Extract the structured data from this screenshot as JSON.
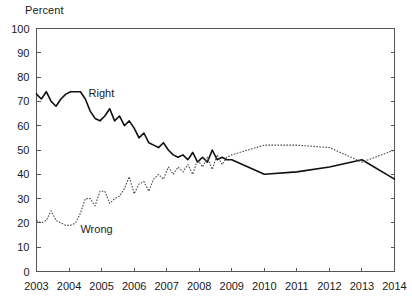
{
  "chart_data": {
    "type": "line",
    "title": "",
    "subtitle": "",
    "xlabel": "",
    "ylabel": "Percent",
    "ylim": [
      0,
      100
    ],
    "xlim": [
      2003,
      2014
    ],
    "grid": false,
    "legend_position": "inline-annotation",
    "yticks": [
      0,
      10,
      20,
      30,
      40,
      50,
      60,
      70,
      80,
      90,
      100
    ],
    "xticks": [
      2003,
      2004,
      2005,
      2006,
      2007,
      2008,
      2009,
      2010,
      2011,
      2012,
      2013,
      2014
    ],
    "xtick_labels": [
      "2003",
      "2004",
      "2005",
      "2006",
      "2007",
      "2008",
      "2009",
      "2010",
      "2011",
      "2012",
      "2013",
      "2014"
    ],
    "ytick_labels": [
      "0",
      "10",
      "20",
      "30",
      "40",
      "50",
      "60",
      "70",
      "80",
      "90",
      "100"
    ],
    "annotations": [
      {
        "text": "Right",
        "x": 2004.6,
        "y": 72
      },
      {
        "text": "Wrong",
        "x": 2004.35,
        "y": 16
      }
    ],
    "series": [
      {
        "name": "Right",
        "style": "solid",
        "color": "#111111",
        "label_text": "Right",
        "x": [
          2003.0,
          2003.15,
          2003.3,
          2003.45,
          2003.6,
          2003.75,
          2003.9,
          2004.05,
          2004.2,
          2004.35,
          2004.5,
          2004.65,
          2004.8,
          2004.95,
          2005.1,
          2005.25,
          2005.4,
          2005.55,
          2005.7,
          2005.85,
          2006.0,
          2006.15,
          2006.3,
          2006.45,
          2006.6,
          2006.75,
          2006.9,
          2007.05,
          2007.2,
          2007.35,
          2007.5,
          2007.65,
          2007.8,
          2007.95,
          2008.1,
          2008.25,
          2008.4,
          2008.55,
          2008.7,
          2008.85,
          2009.0,
          2010.0,
          2011.0,
          2012.0,
          2013.0,
          2014.0
        ],
        "y": [
          73,
          71,
          74,
          70,
          68,
          71,
          73,
          74,
          74,
          74,
          71,
          66,
          63,
          62,
          64,
          67,
          62,
          64,
          60,
          62,
          59,
          55,
          57,
          53,
          52,
          51,
          53,
          50,
          48,
          47,
          48,
          46,
          49,
          45,
          47,
          45,
          50,
          46,
          47,
          46,
          46,
          40,
          41,
          43,
          46,
          38
        ]
      },
      {
        "name": "Wrong",
        "style": "dotted",
        "color": "#4a4a4a",
        "label_text": "Wrong",
        "x": [
          2003.0,
          2003.15,
          2003.3,
          2003.45,
          2003.6,
          2003.75,
          2003.9,
          2004.05,
          2004.2,
          2004.35,
          2004.5,
          2004.65,
          2004.8,
          2004.95,
          2005.1,
          2005.25,
          2005.4,
          2005.55,
          2005.7,
          2005.85,
          2006.0,
          2006.15,
          2006.3,
          2006.45,
          2006.6,
          2006.75,
          2006.9,
          2007.05,
          2007.2,
          2007.35,
          2007.5,
          2007.65,
          2007.8,
          2007.95,
          2008.1,
          2008.25,
          2008.4,
          2008.55,
          2008.7,
          2008.85,
          2009.0,
          2010.0,
          2011.0,
          2012.0,
          2013.0,
          2014.0
        ],
        "y": [
          21,
          20,
          21,
          25,
          21,
          20,
          19,
          19,
          20,
          24,
          30,
          30,
          27,
          33,
          33,
          28,
          30,
          31,
          34,
          39,
          32,
          36,
          37,
          33,
          38,
          40,
          38,
          43,
          40,
          43,
          41,
          44,
          40,
          46,
          43,
          47,
          42,
          48,
          44,
          47,
          48,
          52,
          52,
          51,
          45,
          50
        ]
      }
    ]
  }
}
